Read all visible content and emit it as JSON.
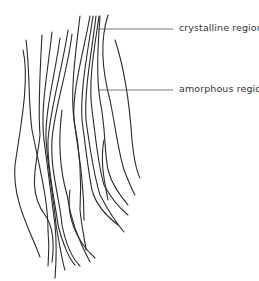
{
  "diagram": {
    "type": "polymer fibre structure schematic",
    "labels": [
      {
        "id": "crystalline",
        "text": "crystalline region"
      },
      {
        "id": "amorphous",
        "text": "amorphous region"
      }
    ]
  }
}
